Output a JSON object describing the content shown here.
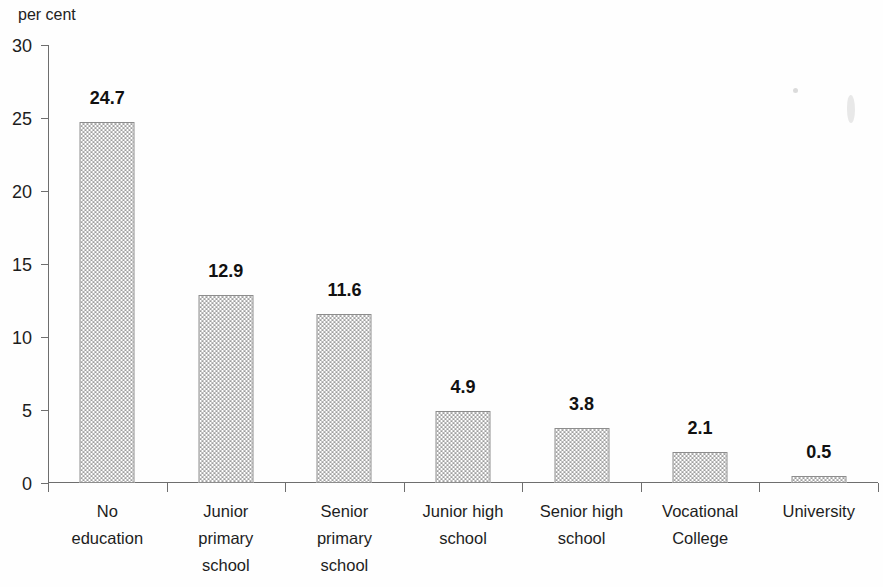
{
  "axis": {
    "unit_caption": "per cent",
    "y_ticks": [
      "30",
      "25",
      "20",
      "15",
      "10",
      "5",
      "0"
    ]
  },
  "chart_data": {
    "type": "bar",
    "title": "",
    "subtitle": "",
    "xlabel": "",
    "ylabel": "per cent",
    "ylim": [
      0,
      30
    ],
    "ytick_values": [
      0,
      5,
      10,
      15,
      20,
      25,
      30
    ],
    "grid": false,
    "legend": null,
    "orientation": "vertical",
    "bar_fill": "#9d9d9d",
    "bar_border": "#8d8d8d",
    "categories": [
      "No education",
      "Junior primary school",
      "Senior primary school",
      "Junior high school",
      "Senior high school",
      "Vocational College",
      "University"
    ],
    "category_lines": [
      [
        "No",
        "education"
      ],
      [
        "Junior",
        "primary",
        "school"
      ],
      [
        "Senior",
        "primary",
        "school"
      ],
      [
        "Junior high",
        "school"
      ],
      [
        "Senior high",
        "school"
      ],
      [
        "Vocational",
        "College"
      ],
      [
        "University"
      ]
    ],
    "values": [
      24.7,
      12.9,
      11.6,
      4.9,
      3.8,
      2.1,
      0.5
    ],
    "value_labels": [
      "24.7",
      "12.9",
      "11.6",
      "4.9",
      "3.8",
      "2.1",
      "0.5"
    ]
  }
}
